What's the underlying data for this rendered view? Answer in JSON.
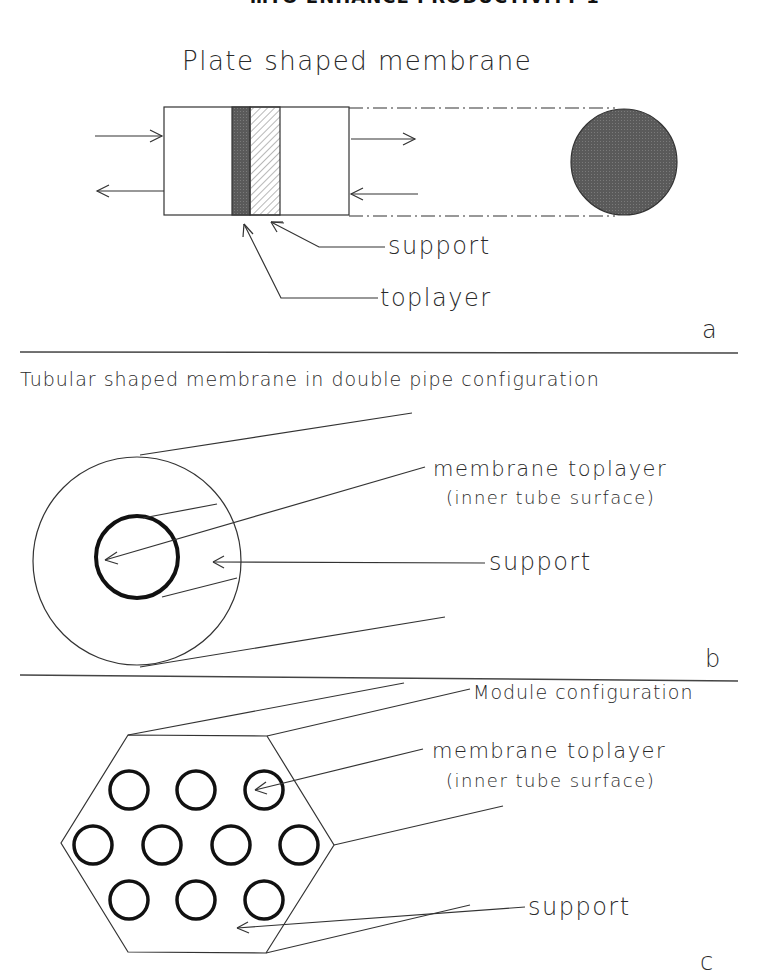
{
  "header": {
    "text": "…TO ENHANCE PRODUCTIVITY  1"
  },
  "panel_a": {
    "title": "Plate shaped membrane",
    "labels": {
      "support": "support",
      "toplayer": "toplayer"
    },
    "panel_letter": "a",
    "colors": {
      "toplayer_fill": "#555555",
      "disc_fill": "#5a5a5a",
      "support_hatch": "#888888"
    }
  },
  "panel_b": {
    "title": "Tubular shaped membrane in double pipe configuration",
    "labels": {
      "membrane_toplayer": "membrane toplayer",
      "inner_surface": "(inner tube surface)",
      "support": "support"
    },
    "panel_letter": "b"
  },
  "panel_c": {
    "labels": {
      "module_configuration": "Module configuration",
      "membrane_toplayer": "membrane toplayer",
      "inner_surface": "(inner tube surface)",
      "support": "support"
    },
    "panel_letter": "c",
    "tube_count": 10
  }
}
